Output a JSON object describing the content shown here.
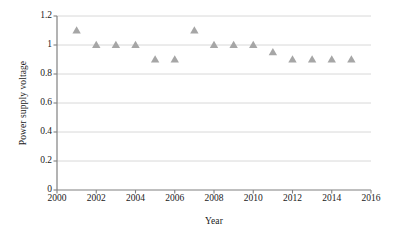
{
  "chart_data": {
    "type": "scatter",
    "title": "",
    "xlabel": "Year",
    "ylabel": "Power supply voltage",
    "xlim": [
      2000,
      2016
    ],
    "ylim": [
      0,
      1.2
    ],
    "xticks": [
      2000,
      2002,
      2004,
      2006,
      2008,
      2010,
      2012,
      2014,
      2016
    ],
    "xtick_labels": [
      "2000",
      "2002",
      "2004",
      "2006",
      "2008",
      "2010",
      "2012",
      "2014",
      "2016"
    ],
    "yticks": [
      0,
      0.2,
      0.4,
      0.6,
      0.8,
      1,
      1.2
    ],
    "ytick_labels": [
      "0",
      "0.2",
      "0.4",
      "0.6",
      "0.8",
      "1",
      "1.2"
    ],
    "grid": "horizontal",
    "legend": "none",
    "marker": "triangle",
    "marker_color": "#a6a6a6",
    "x": [
      2001,
      2002,
      2003,
      2004,
      2005,
      2006,
      2007,
      2008,
      2009,
      2010,
      2011,
      2012,
      2013,
      2014,
      2015
    ],
    "values": [
      1.1,
      1.0,
      1.0,
      1.0,
      0.9,
      0.9,
      1.1,
      1.0,
      1.0,
      1.0,
      0.95,
      0.9,
      0.9,
      0.9,
      0.9
    ],
    "points": [
      {
        "year": "2001",
        "value": "1.1"
      },
      {
        "year": "2002",
        "value": "1"
      },
      {
        "year": "2003",
        "value": "1"
      },
      {
        "year": "2004",
        "value": "1"
      },
      {
        "year": "2005",
        "value": "0.9"
      },
      {
        "year": "2006",
        "value": "0.9"
      },
      {
        "year": "2007",
        "value": "1.1"
      },
      {
        "year": "2008",
        "value": "1"
      },
      {
        "year": "2009",
        "value": "1"
      },
      {
        "year": "2010",
        "value": "1"
      },
      {
        "year": "2011",
        "value": "0.95"
      },
      {
        "year": "2012",
        "value": "0.9"
      },
      {
        "year": "2013",
        "value": "0.9"
      },
      {
        "year": "2014",
        "value": "0.9"
      },
      {
        "year": "2015",
        "value": "0.9"
      }
    ]
  },
  "colors": {
    "marker": "#a6a6a6",
    "gridline": "#d4d4d4",
    "axis": "#808080",
    "text": "#1a1a1a",
    "background": "#ffffff"
  }
}
